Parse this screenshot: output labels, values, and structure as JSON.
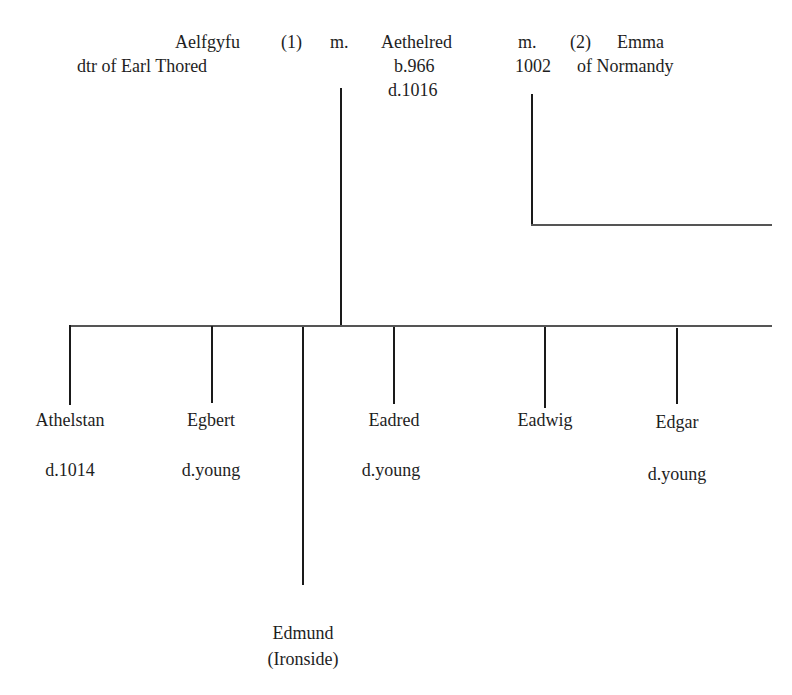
{
  "header_cut_text": "Family tree",
  "parents": {
    "wife1": {
      "name": "Aelfgyfu",
      "order": "(1)",
      "note": "dtr of Earl Thored"
    },
    "marriage1": "m.",
    "husband": {
      "name": "Aethelred",
      "born": "b.966",
      "died": "d.1016"
    },
    "marriage2": {
      "label": "m.",
      "year": "1002"
    },
    "wife2": {
      "order": "(2)",
      "name": "Emma",
      "note": "of Normandy"
    }
  },
  "children": [
    {
      "name": "Athelstan",
      "note": "d.1014"
    },
    {
      "name": "Egbert",
      "note": "d.young"
    },
    {
      "name": "Edmund",
      "note": "(Ironside)"
    },
    {
      "name": "Eadred",
      "note": "d.young"
    },
    {
      "name": "Eadwig",
      "note": ""
    },
    {
      "name": "Edgar",
      "note": "d.young"
    }
  ]
}
